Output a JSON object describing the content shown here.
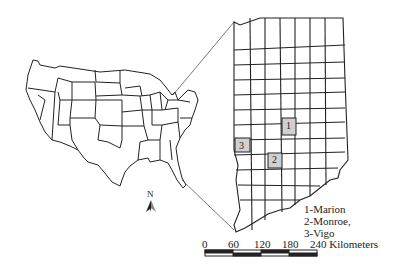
{
  "map": {
    "inset_region": "Indiana",
    "highlight_color": "#d0d0d0",
    "line_color": "#222222",
    "counties": [
      {
        "num": "1",
        "name": "Marion"
      },
      {
        "num": "2",
        "name": "Monroe"
      },
      {
        "num": "3",
        "name": "Vigo"
      }
    ],
    "legend": {
      "line1": "1-Marion",
      "line2": "2-Monroe,",
      "line3": "3-Vigo"
    },
    "north_arrow": {
      "label": "N"
    },
    "scale_bar": {
      "ticks": [
        "0",
        "60",
        "120",
        "180",
        "240 Kilometers"
      ]
    }
  }
}
